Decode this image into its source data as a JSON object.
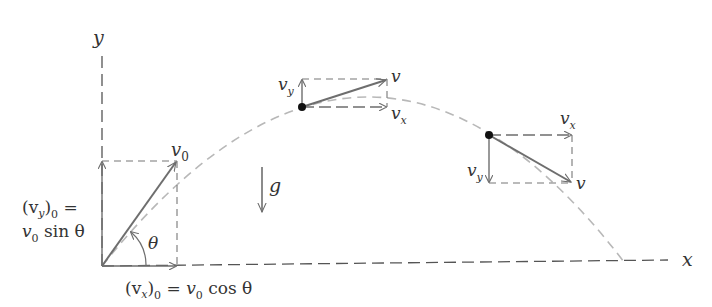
{
  "diagram": {
    "colors": {
      "background": "#ffffff",
      "axis": "#555555",
      "vector": "#6e6e6e",
      "trajectory": "#b8b8b8",
      "component_box": "#777777",
      "point": "#111111",
      "text": "#333333"
    },
    "axes": {
      "x_label": "x",
      "y_label": "y"
    },
    "gravity": {
      "label": "g"
    },
    "launch": {
      "v_label": "v",
      "v_sub": "0",
      "angle_label": "θ",
      "vy_label_line1_open": "(v",
      "vy_label_line1_sub": "y",
      "vy_label_line1_close": ")",
      "vy_label_line1_sub2": "0",
      "vy_label_line1_eq": " =",
      "vy_label_line2_v": "v",
      "vy_label_line2_sub": "0",
      "vy_label_line2_rest": " sin θ",
      "vx_label_open": "(v",
      "vx_label_sub": "x",
      "vx_label_close": ")",
      "vx_label_sub2": "0",
      "vx_label_eq": " = ",
      "vx_label_v": "v",
      "vx_label_vsub": "0",
      "vx_label_rest": " cos θ"
    },
    "rising_point": {
      "v_label": "v",
      "vx_label": "v",
      "vx_sub": "x",
      "vy_label": "v",
      "vy_sub": "y"
    },
    "falling_point": {
      "v_label": "v",
      "vx_label": "v",
      "vx_sub": "x",
      "vy_label": "v",
      "vy_sub": "y"
    }
  }
}
